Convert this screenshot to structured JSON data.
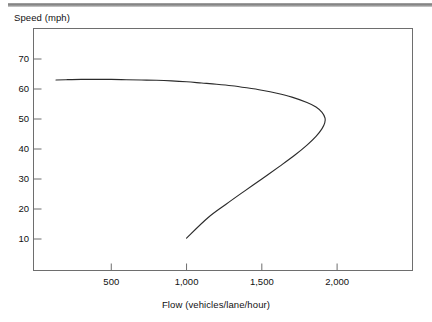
{
  "figure": {
    "top_rule": "horizontal-rule",
    "background_color": "#ffffff",
    "line_color": "#2b2b2b",
    "frame_color": "#6e6e6e"
  },
  "chart_data": {
    "type": "line",
    "title": "",
    "subtitle": "",
    "xlabel": "Flow (vehicles/lane/hour)",
    "ylabel": "Speed (mph)",
    "xlim": [
      0,
      2510
    ],
    "ylim": [
      0,
      79
    ],
    "xticks": [
      500,
      1000,
      1500,
      2000
    ],
    "xtick_labels": [
      "500",
      "1,000",
      "1,500",
      "2,000"
    ],
    "yticks": [
      10,
      20,
      30,
      40,
      50,
      60,
      70
    ],
    "ytick_labels": [
      "10",
      "20",
      "30",
      "40",
      "50",
      "60",
      "70"
    ],
    "grid": false,
    "legend": null,
    "annotations": [],
    "series": [
      {
        "name": "Speed-flow curve",
        "color": "#2b2b2b",
        "x": [
          133,
          200,
          300,
          400,
          500,
          600,
          700,
          800,
          900,
          1000,
          1100,
          1200,
          1300,
          1400,
          1500,
          1600,
          1700,
          1800,
          1860,
          1900,
          1920,
          1918,
          1900,
          1860,
          1800,
          1720,
          1620,
          1500,
          1380,
          1260,
          1140,
          1000
        ],
        "y": [
          63.0,
          63.1,
          63.2,
          63.2,
          63.2,
          63.1,
          63.0,
          62.9,
          62.7,
          62.4,
          62.0,
          61.6,
          61.1,
          60.4,
          59.6,
          58.6,
          57.3,
          55.5,
          54.0,
          52.2,
          50.3,
          48.7,
          46.8,
          44.2,
          41.3,
          38.0,
          34.3,
          30.0,
          25.8,
          21.5,
          17.0,
          10.3
        ]
      }
    ]
  },
  "axes": {
    "y_title": "Speed (mph)",
    "x_title": "Flow (vehicles/lane/hour)"
  }
}
